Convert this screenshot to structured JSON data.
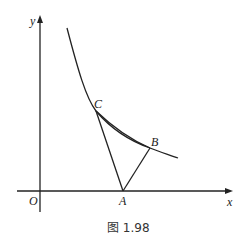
{
  "figure": {
    "caption": "图 1.98",
    "axes": {
      "x_label": "x",
      "y_label": "y",
      "origin_label": "O"
    },
    "points": {
      "A": "A",
      "B": "B",
      "C": "C"
    },
    "stroke_color": "#222222"
  }
}
